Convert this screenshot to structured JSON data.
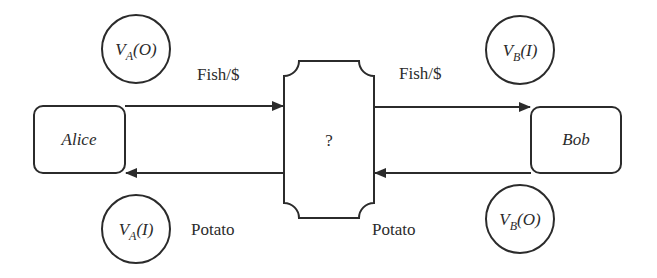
{
  "diagram": {
    "nodes": {
      "alice": {
        "label": "Alice"
      },
      "bob": {
        "label": "Bob"
      },
      "middle": {
        "label": "?"
      }
    },
    "edges": {
      "alice_to_middle": {
        "label": "Fish/$"
      },
      "middle_to_bob": {
        "label": "Fish/$"
      },
      "middle_to_alice": {
        "label": "Potato"
      },
      "bob_to_middle": {
        "label": "Potato"
      }
    },
    "valuations": {
      "va_out": {
        "main": "V",
        "sub": "A",
        "arg": "(O)"
      },
      "vb_in": {
        "main": "V",
        "sub": "B",
        "arg": "(I)"
      },
      "va_in": {
        "main": "V",
        "sub": "A",
        "arg": "(I)"
      },
      "vb_out": {
        "main": "V",
        "sub": "B",
        "arg": "(O)"
      }
    },
    "colors": {
      "stroke": "#2b2b2b",
      "background": "#ffffff"
    }
  }
}
